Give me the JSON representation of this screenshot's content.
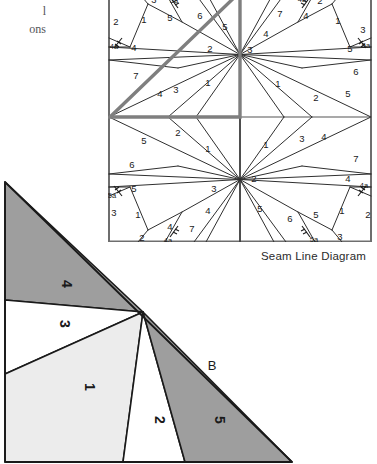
{
  "caption_fragment": {
    "line1": "l",
    "line2": "ons"
  },
  "seam_diagram": {
    "title": "Seam Line Diagram",
    "colors": {
      "line": "#2f2f2f",
      "highlight": "#7f7f7f",
      "border": "#6e6e6e",
      "background": "#ffffff"
    },
    "grid": {
      "cols": 2,
      "rows": 2
    },
    "block_labels": [
      "1",
      "2",
      "3",
      "4",
      "5",
      "6",
      "7",
      "4a",
      "5a"
    ],
    "quadrant_top_left": {
      "labels": [
        {
          "text": "2",
          "x": 8,
          "y": 24
        },
        {
          "text": "1",
          "x": 36,
          "y": 22
        },
        {
          "text": "3",
          "x": 46,
          "y": 2
        },
        {
          "text": "5a",
          "x": 66,
          "y": 2
        },
        {
          "text": "5",
          "x": 62,
          "y": 20
        },
        {
          "text": "6",
          "x": 92,
          "y": 18
        },
        {
          "text": "5",
          "x": 117,
          "y": 29
        },
        {
          "text": "4a",
          "x": 6,
          "y": 48
        },
        {
          "text": "4",
          "x": 26,
          "y": 50
        },
        {
          "text": "2",
          "x": 102,
          "y": 51
        },
        {
          "text": "7",
          "x": 28,
          "y": 78
        },
        {
          "text": "4",
          "x": 52,
          "y": 96
        },
        {
          "text": "3",
          "x": 68,
          "y": 92
        },
        {
          "text": "1",
          "x": 100,
          "y": 85
        }
      ]
    },
    "quadrant_top_right": {
      "labels": [
        {
          "text": "4a",
          "x": 62,
          "y": 1
        },
        {
          "text": "2",
          "x": 80,
          "y": 3
        },
        {
          "text": "7",
          "x": 40,
          "y": 16
        },
        {
          "text": "4",
          "x": 66,
          "y": 18
        },
        {
          "text": "1",
          "x": 98,
          "y": 23
        },
        {
          "text": "3",
          "x": 123,
          "y": 32
        },
        {
          "text": "4",
          "x": 26,
          "y": 36
        },
        {
          "text": "3",
          "x": 10,
          "y": 52
        },
        {
          "text": "5",
          "x": 110,
          "y": 51
        },
        {
          "text": "5a",
          "x": 126,
          "y": 47
        },
        {
          "text": "6",
          "x": 116,
          "y": 74
        },
        {
          "text": "1",
          "x": 38,
          "y": 86
        },
        {
          "text": "2",
          "x": 76,
          "y": 100
        },
        {
          "text": "5",
          "x": 108,
          "y": 96
        }
      ]
    },
    "quadrant_bottom_left": {
      "labels": [
        {
          "text": "5",
          "x": 36,
          "y": 18
        },
        {
          "text": "2",
          "x": 70,
          "y": 10
        },
        {
          "text": "1",
          "x": 100,
          "y": 26
        },
        {
          "text": "6",
          "x": 24,
          "y": 42
        },
        {
          "text": "5",
          "x": 26,
          "y": 66
        },
        {
          "text": "5a",
          "x": 4,
          "y": 72
        },
        {
          "text": "3",
          "x": 106,
          "y": 66
        },
        {
          "text": "3",
          "x": 6,
          "y": 90
        },
        {
          "text": "1",
          "x": 30,
          "y": 92
        },
        {
          "text": "4",
          "x": 100,
          "y": 88
        },
        {
          "text": "4",
          "x": 62,
          "y": 104
        },
        {
          "text": "7",
          "x": 84,
          "y": 106
        },
        {
          "text": "2",
          "x": 34,
          "y": 115
        },
        {
          "text": "4a",
          "x": 60,
          "y": 117
        }
      ]
    },
    "quadrant_bottom_right": {
      "labels": [
        {
          "text": "1",
          "x": 26,
          "y": 22
        },
        {
          "text": "3",
          "x": 62,
          "y": 16
        },
        {
          "text": "4",
          "x": 84,
          "y": 14
        },
        {
          "text": "7",
          "x": 116,
          "y": 36
        },
        {
          "text": "2",
          "x": 14,
          "y": 56
        },
        {
          "text": "4",
          "x": 108,
          "y": 56
        },
        {
          "text": "4a",
          "x": 124,
          "y": 62
        },
        {
          "text": "5",
          "x": 20,
          "y": 86
        },
        {
          "text": "6",
          "x": 50,
          "y": 96
        },
        {
          "text": "5",
          "x": 76,
          "y": 92
        },
        {
          "text": "1",
          "x": 102,
          "y": 88
        },
        {
          "text": "2",
          "x": 128,
          "y": 92
        },
        {
          "text": "5a",
          "x": 74,
          "y": 116
        },
        {
          "text": "3",
          "x": 100,
          "y": 114
        }
      ]
    }
  },
  "unit_triangle": {
    "label_b": "B",
    "colors": {
      "piece_1": "#ececec",
      "piece_2": "#ffffff",
      "piece_3": "#ffffff",
      "piece_4": "#9e9e9e",
      "piece_5": "#9e9e9e",
      "line": "#1a1a1a"
    },
    "pieces": [
      {
        "name": "1",
        "label": "1",
        "fill": "#ececec"
      },
      {
        "name": "2",
        "label": "2",
        "fill": "#ffffff"
      },
      {
        "name": "3",
        "label": "3",
        "fill": "#ffffff"
      },
      {
        "name": "4",
        "label": "4",
        "fill": "#9e9e9e"
      },
      {
        "name": "5",
        "label": "5",
        "fill": "#9e9e9e"
      }
    ]
  }
}
